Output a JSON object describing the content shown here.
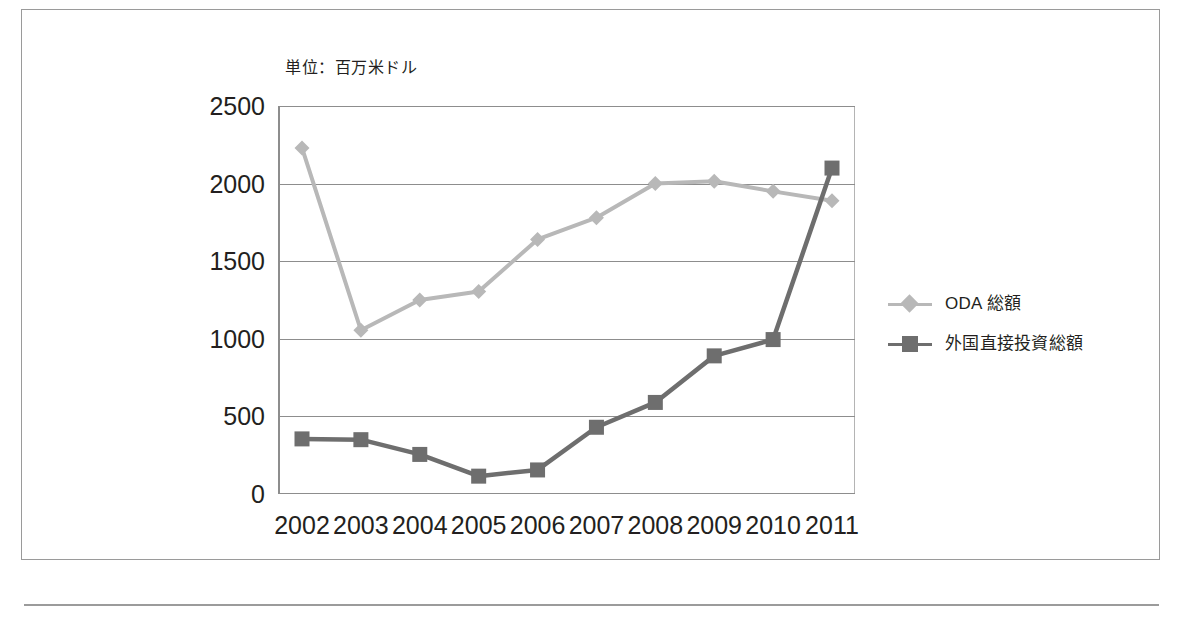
{
  "figure": {
    "unit_note": "単位：百万米ドル"
  },
  "legend": {
    "position": "right",
    "items": [
      {
        "label": "ODA 総額",
        "marker": "diamond",
        "color": "#b8b8b8"
      },
      {
        "label": "外国直接投資総額",
        "marker": "square",
        "color": "#6e6e6e"
      }
    ]
  },
  "colors": {
    "oda_series": "#b8b8b8",
    "fdi_series": "#6e6e6e",
    "gridline": "#8d8d8d",
    "frame": "#9a9a9a",
    "text": "#231f20"
  },
  "axes": {
    "y_ticks": [
      "2500",
      "2000",
      "1500",
      "1000",
      "500",
      "0"
    ],
    "y_tick_values": [
      2500,
      2000,
      1500,
      1000,
      500,
      0
    ],
    "ylim": [
      0,
      2500
    ],
    "x_ticks": [
      "2002",
      "2003",
      "2004",
      "2005",
      "2006",
      "2007",
      "2008",
      "2009",
      "2010",
      "2011"
    ],
    "grid": true
  },
  "chart_data": {
    "type": "line",
    "title": "",
    "subtitle": "",
    "xlabel": "",
    "ylabel": "",
    "unit_note": "単位：百万米ドル",
    "categories": [
      "2002",
      "2003",
      "2004",
      "2005",
      "2006",
      "2007",
      "2008",
      "2009",
      "2010",
      "2011"
    ],
    "ylim": [
      0,
      2500
    ],
    "yticks": [
      0,
      500,
      1000,
      1500,
      2000,
      2500
    ],
    "grid": true,
    "legend_position": "right",
    "series": [
      {
        "name": "ODA 総額",
        "marker": "diamond",
        "color": "#b8b8b8",
        "values": [
          2230,
          1055,
          1250,
          1305,
          1640,
          1780,
          2000,
          2015,
          1950,
          1890
        ]
      },
      {
        "name": "外国直接投資総額",
        "marker": "square",
        "color": "#6e6e6e",
        "values": [
          355,
          350,
          255,
          115,
          155,
          430,
          590,
          890,
          995,
          2100
        ]
      }
    ]
  }
}
